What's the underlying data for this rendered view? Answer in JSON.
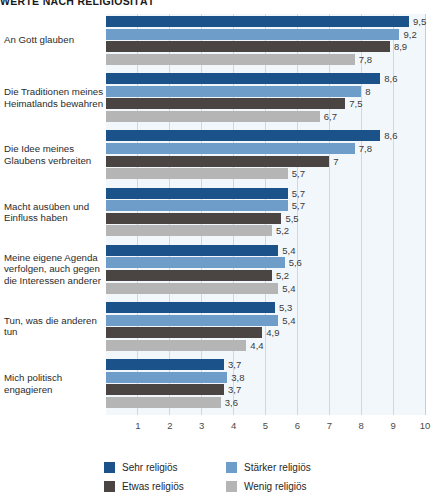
{
  "chart_data": {
    "type": "bar",
    "orientation": "horizontal",
    "title": "WERTE NACH RELIGIOSITÄT",
    "xlabel": "",
    "ylabel": "",
    "xlim": [
      0,
      10
    ],
    "xticks": [
      "1",
      "2",
      "3",
      "4",
      "5",
      "6",
      "7",
      "8",
      "9",
      "10"
    ],
    "grid": true,
    "legend_position": "bottom",
    "categories": [
      "An Gott glauben",
      "Die Traditionen meines Heimatlands bewahren",
      "Die Idee meines Glaubens verbreiten",
      "Macht ausüben und Einfluss haben",
      "Meine eigene Agenda verfolgen, auch gegen die Interessen anderer",
      "Tun, was die anderen tun",
      "Mich politisch engagieren"
    ],
    "series": [
      {
        "name": "Sehr religiös",
        "color": "#1a5289",
        "values": [
          9.5,
          8.6,
          8.6,
          5.7,
          5.4,
          5.3,
          3.7
        ],
        "labels": [
          "9,5",
          "8,6",
          "8,6",
          "5,7",
          "5,4",
          "5,3",
          "3,7"
        ]
      },
      {
        "name": "Stärker religiös",
        "color": "#6e9dc9",
        "values": [
          9.2,
          8.0,
          7.8,
          5.7,
          5.6,
          5.4,
          3.8
        ],
        "labels": [
          "9,2",
          "8",
          "7,8",
          "5,7",
          "5,6",
          "5,4",
          "3,8"
        ]
      },
      {
        "name": "Etwas religiös",
        "color": "#4a4442",
        "values": [
          8.9,
          7.5,
          7.0,
          5.5,
          5.2,
          4.9,
          3.7
        ],
        "labels": [
          "8,9",
          "7,5",
          "7",
          "5,5",
          "5,2",
          "4,9",
          "3,7"
        ]
      },
      {
        "name": "Wenig religiös",
        "color": "#b5b5b5",
        "values": [
          7.8,
          6.7,
          5.7,
          5.2,
          5.4,
          4.4,
          3.6
        ],
        "labels": [
          "7,8",
          "6,7",
          "5,7",
          "5,2",
          "5,4",
          "4,4",
          "3,6"
        ]
      }
    ]
  }
}
